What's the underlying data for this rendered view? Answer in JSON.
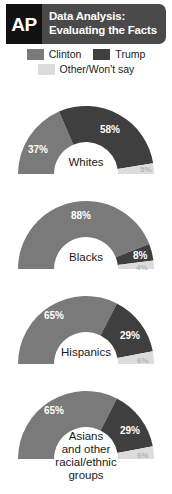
{
  "header": {
    "logo_text": "AP",
    "title_line1": "Data Analysis:",
    "title_line2": "Evaluating the Facts",
    "logo_bg": "#111111",
    "title_bg": "#4a4a4a"
  },
  "legend": {
    "items": [
      {
        "label": "Clinton",
        "color": "#7a7a7a",
        "key": "clinton"
      },
      {
        "label": "Trump",
        "color": "#3f3f3f",
        "key": "trump"
      },
      {
        "label": "Other/Won't say",
        "color": "#dcdcdc",
        "key": "other"
      }
    ]
  },
  "chart_data": {
    "type": "pie",
    "title": "Data Analysis: Evaluating the Facts",
    "subtitle": "",
    "variant": "half-donut",
    "legend_position": "top",
    "series": [
      {
        "name": "Clinton",
        "color": "#7a7a7a"
      },
      {
        "name": "Trump",
        "color": "#3f3f3f"
      },
      {
        "name": "Other/Won't say",
        "color": "#dcdcdc"
      }
    ],
    "categories": [
      "Whites",
      "Blacks",
      "Hispanics",
      "Asians and other racial/ethnic groups"
    ],
    "groups": [
      {
        "label": "Whites",
        "label_lines": [
          "Whites"
        ],
        "values": [
          37,
          58,
          5
        ],
        "labels": [
          "37%",
          "58%",
          "5%"
        ]
      },
      {
        "label": "Blacks",
        "label_lines": [
          "Blacks"
        ],
        "values": [
          88,
          8,
          4
        ],
        "labels": [
          "88%",
          "8%",
          "4%"
        ]
      },
      {
        "label": "Hispanics",
        "label_lines": [
          "Hispanics"
        ],
        "values": [
          65,
          29,
          6
        ],
        "labels": [
          "65%",
          "29%",
          "6%"
        ]
      },
      {
        "label": "Asians and other racial/ethnic groups",
        "label_lines": [
          "Asians",
          "and other",
          "racial/ethnic",
          "groups"
        ],
        "values": [
          65,
          29,
          6
        ],
        "labels": [
          "65%",
          "29%",
          "6%"
        ]
      }
    ],
    "units": "percent",
    "note": "Each half-donut totals 100% across Clinton, Trump, Other/Won't say"
  }
}
